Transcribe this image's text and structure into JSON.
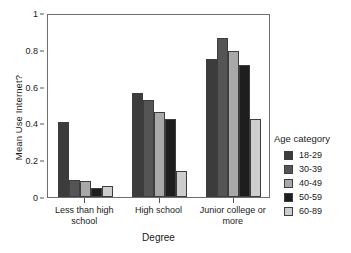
{
  "chart_data": {
    "type": "bar",
    "title": "",
    "subtitle": "",
    "xlabel": "Degree",
    "ylabel": "Mean Use Internet?",
    "categories": [
      "Less than high school",
      "High school",
      "Junior college or more"
    ],
    "series": [
      {
        "name": "18-29",
        "values": [
          0.405,
          0.565,
          0.75
        ],
        "color": "#3c3c3c"
      },
      {
        "name": "30-39",
        "values": [
          0.09,
          0.525,
          0.865
        ],
        "color": "#555555"
      },
      {
        "name": "40-49",
        "values": [
          0.085,
          0.46,
          0.795
        ],
        "color": "#a8a8a8"
      },
      {
        "name": "50-59",
        "values": [
          0.05,
          0.425,
          0.715
        ],
        "color": "#1e1e1e"
      },
      {
        "name": "60-89",
        "values": [
          0.062,
          0.14,
          0.425
        ],
        "color": "#cdcdcd"
      }
    ],
    "ylim": [
      0,
      1
    ],
    "yticks": [
      "0",
      "0.2",
      "0.4",
      "0.6",
      "0.8",
      "1"
    ],
    "ytick_values": [
      0,
      0.2,
      0.4,
      0.6,
      0.8,
      1
    ],
    "grid": false,
    "legend_position": "right",
    "legend_title": "Age category",
    "frame": true
  },
  "legend": {
    "title": "Age category",
    "entries": [
      "18-29",
      "30-39",
      "40-49",
      "50-59",
      "60-89"
    ]
  },
  "axes": {
    "y_title": "Mean Use Internet?",
    "x_title": "Degree"
  }
}
